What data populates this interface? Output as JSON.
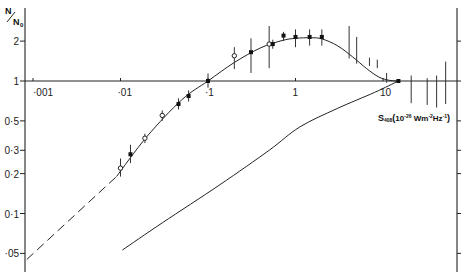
{
  "chart_data": {
    "type": "scatter",
    "title": "",
    "ylabel": "N/N0",
    "ylabel_parts": {
      "main": "N",
      "sub_denominator": "N",
      "sub_index": "0"
    },
    "xlabel": "S408 (10^-26 Wm^-2Hz^-1)",
    "xlabel_parts": {
      "main": "S",
      "subscript": "408",
      "units_open": "(",
      "units_base": "10",
      "units_exp": "-26",
      "units_w": " Wm",
      "units_m_exp": "-2",
      "units_hz": "Hz",
      "units_hz_exp": "-1",
      "units_close": ")"
    },
    "x_scale": "log",
    "y_scale": "log",
    "xlim": [
      0.00085,
      60
    ],
    "ylim": [
      0.04,
      2.6
    ],
    "grid": false,
    "x_axis_crosses_at_y": 1,
    "x_ticks": [
      {
        "value": 0.001,
        "label": "·001"
      },
      {
        "value": 0.01,
        "label": "·01"
      },
      {
        "value": 0.1,
        "label": "·1"
      },
      {
        "value": 1,
        "label": "1"
      },
      {
        "value": 10,
        "label": "10"
      }
    ],
    "y_ticks": [
      {
        "value": 2,
        "label": "2"
      },
      {
        "value": 1,
        "label": "1"
      },
      {
        "value": 0.5,
        "label": "0·5"
      },
      {
        "value": 0.3,
        "label": "0·3"
      },
      {
        "value": 0.2,
        "label": "0·2"
      },
      {
        "value": 0.1,
        "label": "0·1"
      },
      {
        "value": 0.05,
        "label": "·05"
      }
    ],
    "points": [
      {
        "x": 0.01,
        "y": 0.22,
        "ylo": 0.19,
        "yhi": 0.26,
        "marker": "open"
      },
      {
        "x": 0.013,
        "y": 0.28,
        "ylo": 0.24,
        "yhi": 0.33,
        "marker": "filled"
      },
      {
        "x": 0.019,
        "y": 0.37,
        "ylo": 0.34,
        "yhi": 0.4,
        "marker": "open"
      },
      {
        "x": 0.03,
        "y": 0.55,
        "ylo": 0.5,
        "yhi": 0.6,
        "marker": "open"
      },
      {
        "x": 0.046,
        "y": 0.67,
        "ylo": 0.61,
        "yhi": 0.74,
        "marker": "filled"
      },
      {
        "x": 0.06,
        "y": 0.77,
        "ylo": 0.7,
        "yhi": 0.85,
        "marker": "filled"
      },
      {
        "x": 0.1,
        "y": 1.0,
        "ylo": 0.89,
        "yhi": 1.14,
        "marker": "filled"
      },
      {
        "x": 0.2,
        "y": 1.55,
        "ylo": 1.23,
        "yhi": 1.8,
        "marker": "open"
      },
      {
        "x": 0.31,
        "y": 1.65,
        "ylo": 1.15,
        "yhi": 2.1,
        "marker": "filled"
      },
      {
        "x": 0.5,
        "y": 1.9,
        "ylo": 1.25,
        "yhi": 2.6,
        "marker": "open"
      },
      {
        "x": 0.55,
        "y": 1.9,
        "ylo": 1.75,
        "yhi": 2.05,
        "marker": "filled"
      },
      {
        "x": 0.73,
        "y": 2.2,
        "ylo": 2.0,
        "yhi": 2.35,
        "marker": "filled"
      },
      {
        "x": 1.0,
        "y": 2.15,
        "ylo": 1.8,
        "yhi": 2.45,
        "marker": "filled"
      },
      {
        "x": 1.45,
        "y": 2.15,
        "ylo": 1.85,
        "yhi": 2.45,
        "marker": "filled"
      },
      {
        "x": 2.0,
        "y": 2.15,
        "ylo": 1.85,
        "yhi": 2.45,
        "marker": "filled"
      },
      {
        "x": 4.1,
        "y": null,
        "ylo": 1.48,
        "yhi": 2.6,
        "marker": "none"
      },
      {
        "x": 5.0,
        "y": null,
        "ylo": 1.35,
        "yhi": 2.15,
        "marker": "none"
      },
      {
        "x": 7.0,
        "y": null,
        "ylo": 1.3,
        "yhi": 1.5,
        "marker": "none"
      },
      {
        "x": 8.6,
        "y": null,
        "ylo": 1.25,
        "yhi": 1.45,
        "marker": "none"
      },
      {
        "x": 11.0,
        "y": null,
        "ylo": 0.97,
        "yhi": 1.15,
        "marker": "none"
      },
      {
        "x": 15.0,
        "y": 1.0,
        "ylo": 1.0,
        "yhi": 1.0,
        "marker": "filled"
      },
      {
        "x": 21.0,
        "y": null,
        "ylo": 0.68,
        "yhi": 1.1,
        "marker": "none"
      },
      {
        "x": 32.0,
        "y": null,
        "ylo": 0.66,
        "yhi": 1.05,
        "marker": "none"
      },
      {
        "x": 41.0,
        "y": null,
        "ylo": 0.63,
        "yhi": 1.1,
        "marker": "none"
      },
      {
        "x": 52.0,
        "y": null,
        "ylo": 0.67,
        "yhi": 1.4,
        "marker": "none"
      }
    ],
    "series": [
      {
        "name": "fit-extrapolation",
        "style": "dashed",
        "x": [
          0.00085,
          0.009
        ],
        "y": [
          0.045,
          0.19
        ]
      },
      {
        "name": "fit",
        "style": "solid",
        "x": [
          0.009,
          0.02,
          0.05,
          0.1,
          0.2,
          0.4,
          0.7,
          1.0,
          1.5,
          2.0,
          3.0,
          4.5,
          6.5,
          9.0,
          12.0,
          15.0
        ],
        "y": [
          0.19,
          0.38,
          0.72,
          1.0,
          1.38,
          1.78,
          2.02,
          2.1,
          2.12,
          2.08,
          1.85,
          1.52,
          1.24,
          1.07,
          1.01,
          1.0
        ]
      },
      {
        "name": "lower-curve",
        "style": "solid",
        "x": [
          0.0105,
          0.03,
          0.137,
          0.5,
          1.12,
          3.0,
          8.0,
          15.0
        ],
        "y": [
          0.053,
          0.085,
          0.165,
          0.3,
          0.45,
          0.62,
          0.82,
          1.0
        ]
      }
    ]
  }
}
